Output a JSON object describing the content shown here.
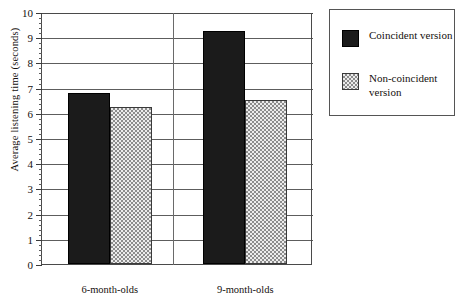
{
  "chart_data": {
    "type": "bar",
    "title": "",
    "xlabel": "",
    "ylabel": "Average listening time (seconds)",
    "categories": [
      "6-month-olds",
      "9-month-olds"
    ],
    "series": [
      {
        "name": "Coincident version",
        "values": [
          6.8,
          9.25
        ],
        "fill": "solid-black",
        "color": "#1b1b1b"
      },
      {
        "name": "Non-coincident version",
        "values": [
          6.25,
          6.5
        ],
        "fill": "stippled-checker",
        "color": "#ececec"
      }
    ],
    "ylim": [
      0,
      10
    ],
    "ytick_labels": [
      "0",
      "1",
      "2",
      "3",
      "4",
      "5",
      "6",
      "7",
      "8",
      "9",
      "10"
    ],
    "ytick_values": [
      0,
      1,
      2,
      3,
      4,
      5,
      6,
      7,
      8,
      9,
      10
    ],
    "minor_ticks_per_interval": 4,
    "grid": "horizontal-major",
    "legend_position": "right-outside",
    "group_separator": true
  },
  "legend": {
    "items": [
      {
        "label": "Coincident version",
        "swatch": "solid-black-swatch"
      },
      {
        "label": "Non-coincident version",
        "swatch": "stippled-swatch"
      }
    ]
  }
}
